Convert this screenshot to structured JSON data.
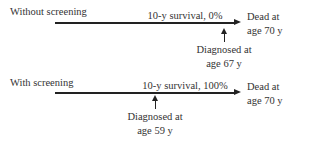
{
  "scenarios": [
    {
      "label": "Without screening",
      "survival": "10-y survival, 0%",
      "diagnosed": [
        "Diagnosed at",
        "age 67 y"
      ],
      "endpoint": [
        "Dead at",
        "age 70 y"
      ]
    },
    {
      "label": "With screening",
      "survival": "10-y survival, 100%",
      "diagnosed": [
        "Diagnosed at",
        "age 59 y"
      ],
      "endpoint": [
        "Dead at",
        "age 70 y"
      ]
    }
  ],
  "colors": {
    "line": "#222222",
    "text": "#333333"
  }
}
